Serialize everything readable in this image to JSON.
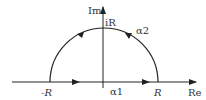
{
  "diagram": {
    "axes": {
      "x_label": "Re",
      "y_label": "Im"
    },
    "points": {
      "left": "-R",
      "right": "R",
      "top": "iR"
    },
    "paths": {
      "segment": "α1",
      "arc": "α2"
    },
    "colors": {
      "stroke": "#222222",
      "background": "#ffffff"
    }
  }
}
